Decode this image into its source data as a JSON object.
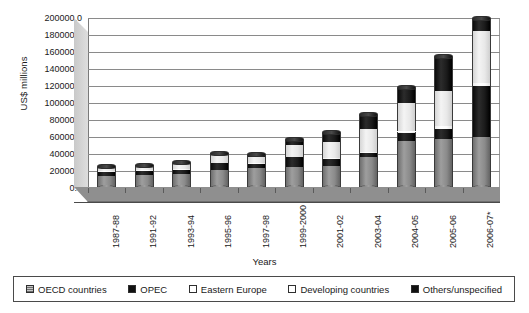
{
  "chart_data": {
    "type": "bar",
    "subtype": "stacked-cylinder-3d",
    "title": "",
    "xlabel": "Years",
    "ylabel": "US$ millions",
    "ylim": [
      0,
      200000
    ],
    "ytick_step": 20000,
    "grid": true,
    "legend_position": "bottom",
    "yticks": [
      "0.0",
      "20000.0",
      "40000.0",
      "60000.0",
      "80000.0",
      "100000.0",
      "120000.0",
      "140000.0",
      "160000.0",
      "180000.0",
      "200000.0"
    ],
    "categories": [
      "1987-88",
      "1991-92",
      "1993-94",
      "1995-96",
      "1997-98",
      "1999-2000",
      "2001-02",
      "2003-04",
      "2004-05",
      "2005-06",
      "2006-07*"
    ],
    "series": [
      {
        "name": "OECD countries",
        "color": "#8d8d8d",
        "pattern": "solid-gray",
        "values": [
          14500,
          15000,
          16500,
          21000,
          23000,
          25000,
          26000,
          37000,
          55000,
          58000,
          60000
        ]
      },
      {
        "name": "OPEC",
        "color": "#151515",
        "pattern": "solid-black",
        "values": [
          4500,
          5500,
          5000,
          8000,
          5000,
          11000,
          8000,
          4000,
          9500,
          12000,
          60000
        ]
      },
      {
        "name": "Eastern Europe",
        "color": "#ffffff",
        "pattern": "solid-white",
        "values": [
          500,
          600,
          700,
          800,
          900,
          1000,
          1200,
          1500,
          2000,
          2500,
          3000
        ]
      },
      {
        "name": "Developing countries",
        "color": "#eaeaea",
        "pattern": "light-gray",
        "values": [
          4000,
          4500,
          6000,
          9000,
          8000,
          14000,
          19000,
          27000,
          34000,
          42000,
          62000
        ]
      },
      {
        "name": "Others/unspecified",
        "color": "#151515",
        "pattern": "solid-black",
        "values": [
          1500,
          1400,
          1800,
          2200,
          2100,
          6000,
          11000,
          17000,
          17500,
          40000,
          14000
        ]
      }
    ],
    "totals": [
      25000,
      27000,
      30000,
      41000,
      39000,
      57000,
      65200,
      86500,
      118000,
      154500,
      199000
    ]
  },
  "legend": {
    "items": [
      {
        "label": "OECD countries",
        "swatch": "hatch-gray"
      },
      {
        "label": "OPEC",
        "swatch": "black"
      },
      {
        "label": "Eastern Europe",
        "swatch": "white"
      },
      {
        "label": "Developing countries",
        "swatch": "white"
      },
      {
        "label": "Others/unspecified",
        "swatch": "black"
      }
    ]
  }
}
